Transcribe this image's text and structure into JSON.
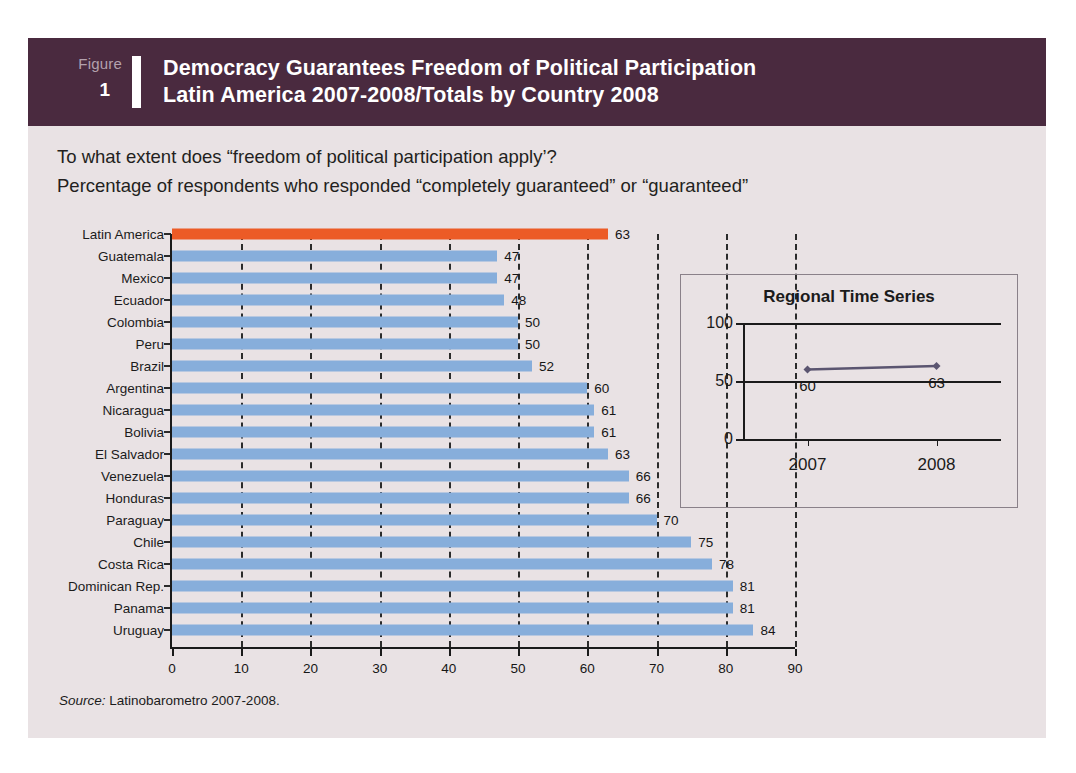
{
  "figure": {
    "badge_word": "Figure",
    "badge_number": "1",
    "title_line1": "Democracy Guarantees Freedom of Political Participation",
    "title_line2": "Latin America 2007-2008/Totals by Country 2008",
    "header_color": "#4a2a3f",
    "card_background": "#e9e2e4"
  },
  "question": {
    "line1": "To what extent does “freedom of political participation apply’?",
    "line2": "Percentage of respondents who responded “completely guaranteed” or “guaranteed”"
  },
  "source": {
    "label": "Source:",
    "text": " Latinobarometro 2007-2008."
  },
  "colors": {
    "bar_blue": "#87aedb",
    "bar_highlight_orange": "#ec5b26",
    "axis": "#1a1a1a",
    "gridline": "#2b2b2b",
    "inset_line": "#5b5570"
  },
  "chart_data": {
    "type": "bar",
    "orientation": "horizontal",
    "title": "Democracy Guarantees Freedom of Political Participation",
    "subtitle": "Latin America 2007-2008/Totals by Country 2008",
    "xlabel": "",
    "ylabel": "",
    "xlim": [
      0,
      90
    ],
    "xticks": [
      0,
      10,
      20,
      30,
      40,
      50,
      60,
      70,
      80,
      90
    ],
    "grid": true,
    "legend": false,
    "categories": [
      "Latin America",
      "Guatemala",
      "Mexico",
      "Ecuador",
      "Colombia",
      "Peru",
      "Brazil",
      "Argentina",
      "Nicaragua",
      "Bolivia",
      "El Salvador",
      "Venezuela",
      "Honduras",
      "Paraguay",
      "Chile",
      "Costa Rica",
      "Dominican Rep.",
      "Panama",
      "Uruguay"
    ],
    "values": [
      63,
      47,
      47,
      48,
      50,
      50,
      52,
      60,
      61,
      61,
      63,
      66,
      66,
      70,
      75,
      78,
      81,
      81,
      84
    ],
    "highlight_index": 0,
    "highlight_label": "Latin America"
  },
  "inset_chart": {
    "type": "line",
    "title": "Regional Time Series",
    "x": [
      "2007",
      "2008"
    ],
    "values": [
      60,
      63
    ],
    "point_labels": [
      "60",
      "63"
    ],
    "ylim": [
      0,
      100
    ],
    "yticks": [
      0,
      50,
      100
    ],
    "grid": true,
    "legend": false
  }
}
